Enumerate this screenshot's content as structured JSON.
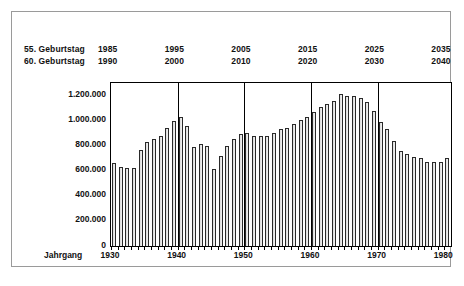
{
  "chart_data": {
    "type": "bar",
    "title": "",
    "xlabel": "Jahrgang",
    "ylabel": "",
    "ylim": [
      0,
      1300000
    ],
    "grid": true,
    "legend_position": "none",
    "y_ticks": [
      "0",
      "200.000",
      "400.000",
      "600.000",
      "800.000",
      "1.000.000",
      "1.200.000"
    ],
    "y_tick_values": [
      0,
      200000,
      400000,
      600000,
      800000,
      1000000,
      1200000
    ],
    "x_ticks": [
      "1930",
      "1940",
      "1950",
      "1960",
      "1970",
      "1980"
    ],
    "x_tick_values": [
      1930,
      1940,
      1950,
      1960,
      1970,
      1980
    ],
    "categories": [
      1930,
      1931,
      1932,
      1933,
      1934,
      1935,
      1936,
      1937,
      1938,
      1939,
      1940,
      1941,
      1942,
      1943,
      1944,
      1945,
      1946,
      1947,
      1948,
      1949,
      1950,
      1951,
      1952,
      1953,
      1954,
      1955,
      1956,
      1957,
      1958,
      1959,
      1960,
      1961,
      1962,
      1963,
      1964,
      1965,
      1966,
      1967,
      1968,
      1969,
      1970,
      1971,
      1972,
      1973,
      1974,
      1975,
      1976,
      1977,
      1978,
      1979,
      1980
    ],
    "values": [
      665000,
      632000,
      625000,
      625000,
      765000,
      830000,
      855000,
      875000,
      940000,
      1000000,
      1025000,
      955000,
      790000,
      810000,
      800000,
      615000,
      720000,
      795000,
      855000,
      895000,
      900000,
      875000,
      880000,
      880000,
      905000,
      935000,
      940000,
      975000,
      1005000,
      1025000,
      1070000,
      1110000,
      1135000,
      1155000,
      1215000,
      1200000,
      1200000,
      1180000,
      1145000,
      1080000,
      990000,
      930000,
      840000,
      760000,
      735000,
      710000,
      705000,
      670000,
      670000,
      672000,
      705000
    ],
    "series_name": "Geburten"
  },
  "annotations": {
    "row_55": {
      "label": "55. Geburtstag",
      "years": [
        "1985",
        "1995",
        "2005",
        "2015",
        "2025",
        "2035"
      ]
    },
    "row_60": {
      "label": "60. Geburtstag",
      "years": [
        "1990",
        "2000",
        "2010",
        "2020",
        "2030",
        "2040"
      ]
    }
  },
  "colors": {
    "bar_outline": "#2a2a2a",
    "bar_fill": "#c8c8c8",
    "axis": "#000000",
    "frame": "#9a9a9a",
    "text": "#111111",
    "background": "#ffffff"
  }
}
